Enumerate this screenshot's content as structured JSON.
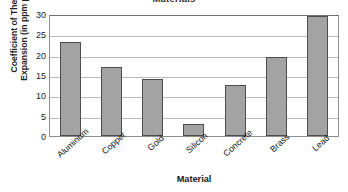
{
  "chart_data": {
    "type": "bar",
    "title": "Materials",
    "xlabel": "Material",
    "ylabel": "Coefficient of Thermal Expansion (in ppm per °C)",
    "ylabel_line1": "Coefficient of Thermal",
    "ylabel_line2": "Expansion (in ppm per °C)",
    "categories": [
      "Aluminum",
      "Copper",
      "Gold",
      "Silicon",
      "Concrete",
      "Brass",
      "Lead"
    ],
    "values": [
      23,
      17,
      14,
      3,
      12.5,
      19.5,
      29.5
    ],
    "ylim": [
      0,
      30
    ],
    "ytick_labels": [
      "0",
      "5",
      "10",
      "15",
      "20",
      "25",
      "30"
    ],
    "ytick_values": [
      0,
      5,
      10,
      15,
      20,
      25,
      30
    ],
    "grid": "horizontal",
    "legend": "none",
    "bar_color": "#a3a3a3",
    "bar_edge_color": "#4d4d4d",
    "gridline_color": "#b9b9b9",
    "axis_color": "#8d8d8d",
    "title_note": "Title is clipped at the top edge of the screenshot; only the lower portion of the glyphs is visible."
  }
}
